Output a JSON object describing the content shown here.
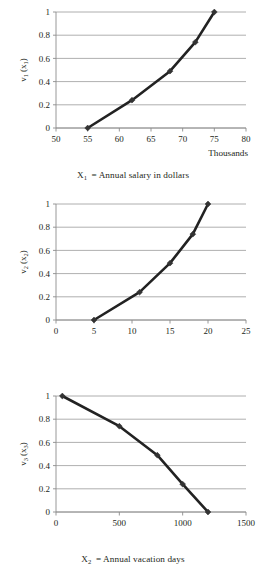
{
  "document": {
    "kind": "figure-panel",
    "panel_count": 3
  },
  "chart_data": [
    {
      "id": "chart-1",
      "type": "line",
      "title": "",
      "caption": "X1 = Annual salary in dollars",
      "caption_var": "X",
      "caption_var_sub": "1",
      "caption_rest": "= Annual salary in dollars",
      "xlabel": "Thousands",
      "ylabel": "v1 (x1)",
      "ylabel_main": "v",
      "ylabel_main_sub": "1",
      "ylabel_arg": "(x",
      "ylabel_arg_sub": "1",
      "ylabel_close": ")",
      "xlim": [
        50,
        80
      ],
      "ylim": [
        0,
        1
      ],
      "xticks": [
        "50",
        "55",
        "60",
        "65",
        "70",
        "75",
        "80"
      ],
      "xtick_values": [
        50,
        55,
        60,
        65,
        70,
        75,
        80
      ],
      "yticks": [
        "0",
        "0.2",
        "0.4",
        "0.6",
        "0.8",
        "1"
      ],
      "ytick_values": [
        0,
        0.2,
        0.4,
        0.6,
        0.8,
        1
      ],
      "grid": true,
      "legend": "none",
      "markers": "diamond",
      "x": [
        55,
        62,
        68,
        72,
        75
      ],
      "y": [
        0.0,
        0.24,
        0.49,
        0.74,
        1.0
      ]
    },
    {
      "id": "chart-2",
      "type": "line",
      "title": "",
      "caption": "X2 = Annual vacation days",
      "caption_var": "X",
      "caption_var_sub": "2",
      "caption_rest": "= Annual vacation days",
      "xlabel": "",
      "ylabel": "v2 (x2)",
      "ylabel_main": "v",
      "ylabel_main_sub": "2",
      "ylabel_arg": "(x",
      "ylabel_arg_sub": "2",
      "ylabel_close": ")",
      "xlim": [
        0,
        25
      ],
      "ylim": [
        0,
        1
      ],
      "xticks": [
        "0",
        "5",
        "10",
        "15",
        "20",
        "25"
      ],
      "xtick_values": [
        0,
        5,
        10,
        15,
        20,
        25
      ],
      "yticks": [
        "0",
        "0.2",
        "0.4",
        "0.6",
        "0.8",
        "1"
      ],
      "ytick_values": [
        0,
        0.2,
        0.4,
        0.6,
        0.8,
        1
      ],
      "grid": true,
      "legend": "none",
      "markers": "diamond",
      "x": [
        5,
        11,
        15,
        18,
        20
      ],
      "y": [
        0.0,
        0.24,
        0.49,
        0.74,
        1.0
      ]
    },
    {
      "id": "chart-3",
      "type": "line",
      "title": "",
      "caption": "X3 = Miles from hometown",
      "caption_var": "X",
      "caption_var_sub": "3",
      "caption_rest": "= Miles from hometown",
      "xlabel": "",
      "ylabel": "v3 (x3)",
      "ylabel_main": "v",
      "ylabel_main_sub": "3",
      "ylabel_arg": "(x",
      "ylabel_arg_sub": "3",
      "ylabel_close": ")",
      "xlim": [
        0,
        1500
      ],
      "ylim": [
        0,
        1
      ],
      "xticks": [
        "0",
        "500",
        "1000",
        "1500"
      ],
      "xtick_values": [
        0,
        500,
        1000,
        1500
      ],
      "yticks": [
        "0",
        "0.2",
        "0.4",
        "0.6",
        "0.8",
        "1"
      ],
      "ytick_values": [
        0,
        0.2,
        0.4,
        0.6,
        0.8,
        1
      ],
      "grid": true,
      "legend": "none",
      "markers": "diamond",
      "x": [
        50,
        500,
        800,
        1000,
        1200
      ],
      "y": [
        1.0,
        0.74,
        0.49,
        0.24,
        0.0
      ]
    }
  ],
  "colors": {
    "line": "#222222",
    "marker": "#333333",
    "grid": "#9a9a9a",
    "axis": "#8c8c8c",
    "text": "#231f20",
    "background": "#ffffff"
  }
}
